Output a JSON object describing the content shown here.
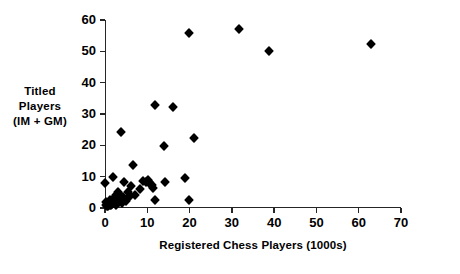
{
  "chart_data": {
    "type": "scatter",
    "title": "",
    "xlabel": "Registered Chess Players (1000s)",
    "ylabel": "Titled Players (IM + GM)",
    "ylabel_lines": [
      "Titled",
      "Players",
      "(IM + GM)"
    ],
    "xlim": [
      0,
      70
    ],
    "ylim": [
      0,
      60
    ],
    "xticks": [
      0,
      10,
      20,
      30,
      40,
      50,
      60,
      70
    ],
    "yticks": [
      0,
      10,
      20,
      30,
      40,
      50,
      60
    ],
    "xtick_labels": [
      "0",
      "10",
      "20",
      "30",
      "40",
      "50",
      "60",
      "70"
    ],
    "ytick_labels": [
      "0",
      "10",
      "20",
      "30",
      "40",
      "50",
      "60"
    ],
    "grid": false,
    "legend": false,
    "marker": "diamond",
    "marker_color": "#000000",
    "points": [
      {
        "x": 0.1,
        "y": 8.1
      },
      {
        "x": 0.2,
        "y": 2.0
      },
      {
        "x": 0.3,
        "y": 1.0
      },
      {
        "x": 0.4,
        "y": 0.6
      },
      {
        "x": 0.6,
        "y": 1.4
      },
      {
        "x": 0.8,
        "y": 0.5
      },
      {
        "x": 1.0,
        "y": 1.8
      },
      {
        "x": 1.1,
        "y": 0.8
      },
      {
        "x": 1.3,
        "y": 2.4
      },
      {
        "x": 1.5,
        "y": 0.9
      },
      {
        "x": 1.7,
        "y": 1.2
      },
      {
        "x": 1.9,
        "y": 10.0
      },
      {
        "x": 2.0,
        "y": 3.0
      },
      {
        "x": 2.1,
        "y": 1.6
      },
      {
        "x": 2.3,
        "y": 2.2
      },
      {
        "x": 2.5,
        "y": 4.2
      },
      {
        "x": 2.6,
        "y": 1.1
      },
      {
        "x": 2.8,
        "y": 3.6
      },
      {
        "x": 3.0,
        "y": 2.8
      },
      {
        "x": 3.1,
        "y": 5.0
      },
      {
        "x": 3.3,
        "y": 2.0
      },
      {
        "x": 3.4,
        "y": 4.6
      },
      {
        "x": 3.6,
        "y": 3.2
      },
      {
        "x": 3.8,
        "y": 24.4
      },
      {
        "x": 3.9,
        "y": 2.5
      },
      {
        "x": 4.1,
        "y": 1.5
      },
      {
        "x": 4.3,
        "y": 3.4
      },
      {
        "x": 4.6,
        "y": 8.2
      },
      {
        "x": 5.0,
        "y": 2.2
      },
      {
        "x": 5.4,
        "y": 5.0
      },
      {
        "x": 5.8,
        "y": 3.9
      },
      {
        "x": 6.2,
        "y": 7.0
      },
      {
        "x": 6.6,
        "y": 13.7
      },
      {
        "x": 7.0,
        "y": 4.0
      },
      {
        "x": 8.2,
        "y": 6.0
      },
      {
        "x": 9.0,
        "y": 8.7
      },
      {
        "x": 9.6,
        "y": 8.3
      },
      {
        "x": 10.1,
        "y": 9.0
      },
      {
        "x": 10.4,
        "y": 8.4
      },
      {
        "x": 10.7,
        "y": 7.6
      },
      {
        "x": 11.0,
        "y": 7.2
      },
      {
        "x": 11.3,
        "y": 6.4
      },
      {
        "x": 11.8,
        "y": 33.0
      },
      {
        "x": 11.9,
        "y": 2.7
      },
      {
        "x": 14.0,
        "y": 19.7
      },
      {
        "x": 14.2,
        "y": 8.3
      },
      {
        "x": 16.0,
        "y": 32.2
      },
      {
        "x": 19.0,
        "y": 9.6
      },
      {
        "x": 19.8,
        "y": 2.7
      },
      {
        "x": 19.9,
        "y": 56.0
      },
      {
        "x": 21.0,
        "y": 22.3
      },
      {
        "x": 31.8,
        "y": 57.0
      },
      {
        "x": 38.8,
        "y": 50.0
      },
      {
        "x": 62.9,
        "y": 52.2
      }
    ]
  }
}
